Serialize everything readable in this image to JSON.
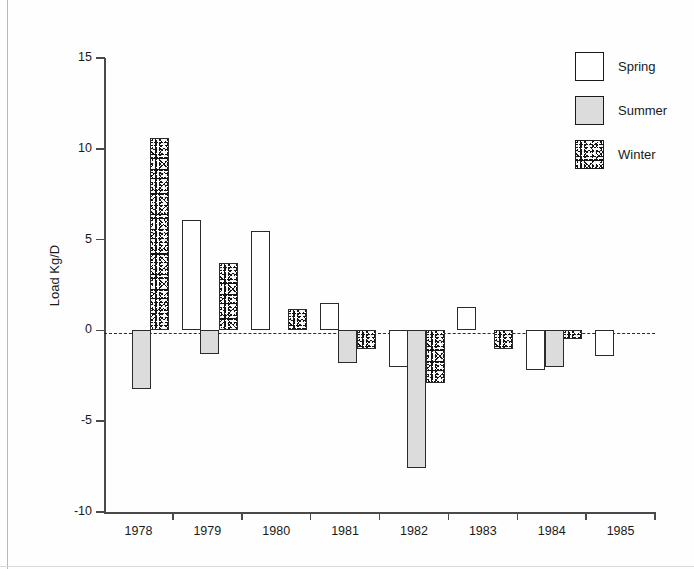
{
  "chart_data": {
    "type": "bar",
    "title": "",
    "subtitle": "",
    "xlabel": "",
    "ylabel": "Load Kg/D",
    "categories": [
      "1978",
      "1979",
      "1980",
      "1981",
      "1982",
      "1983",
      "1984",
      "1985"
    ],
    "series": [
      {
        "name": "Spring",
        "values": [
          null,
          6.1,
          5.5,
          1.5,
          -2.0,
          1.3,
          -2.2,
          -1.4
        ]
      },
      {
        "name": "Summer",
        "values": [
          -3.2,
          -1.3,
          null,
          -1.8,
          -7.6,
          null,
          -2.0,
          null
        ]
      },
      {
        "name": "Winter",
        "values": [
          10.6,
          3.7,
          1.2,
          -1.0,
          -2.9,
          -1.0,
          -0.5,
          null
        ]
      }
    ],
    "ylim": [
      -10,
      15
    ],
    "yticks": [
      15,
      10,
      5,
      0,
      -5,
      -10
    ],
    "ytick_labels": [
      "15",
      "10",
      "5",
      "0",
      "-5",
      "-10"
    ],
    "grid": false,
    "zero_line": "dashed",
    "legend_position": "top-right",
    "legend_entries": [
      {
        "label": "Spring",
        "fill": "white",
        "color": "#ffffff"
      },
      {
        "label": "Summer",
        "fill": "light-gray",
        "color": "#dcdcdc"
      },
      {
        "label": "Winter",
        "fill": "speckled-black",
        "color": "#151515"
      }
    ]
  },
  "axis": {
    "y_title": "Load Kg/D",
    "y_ticks": [
      "15",
      "10",
      "5",
      "0",
      "-5",
      "-10"
    ],
    "x_ticks": [
      "1978",
      "1979",
      "1980",
      "1981",
      "1982",
      "1983",
      "1984",
      "1985"
    ]
  },
  "legend": {
    "items": [
      {
        "label": "Spring"
      },
      {
        "label": "Summer"
      },
      {
        "label": "Winter"
      }
    ]
  }
}
